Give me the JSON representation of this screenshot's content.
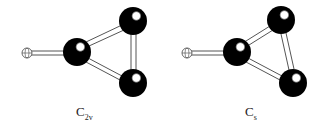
{
  "figure": {
    "type": "molecular-structure-comparison",
    "molecules": [
      {
        "symmetry_label": "C",
        "symmetry_subscript": "2v",
        "atoms": [
          {
            "role": "hydrogen",
            "x": 27,
            "y": 53,
            "r": 5
          },
          {
            "role": "heavy-center",
            "x": 77,
            "y": 52,
            "r": 14
          },
          {
            "role": "heavy-top",
            "x": 133,
            "y": 21,
            "r": 14
          },
          {
            "role": "heavy-bottom",
            "x": 133,
            "y": 83,
            "r": 14
          }
        ]
      },
      {
        "symmetry_label": "C",
        "symmetry_subscript": "s",
        "atoms": [
          {
            "role": "hydrogen",
            "x": 187,
            "y": 53,
            "r": 5
          },
          {
            "role": "heavy-center",
            "x": 237,
            "y": 52,
            "r": 14
          },
          {
            "role": "heavy-top",
            "x": 281,
            "y": 20,
            "r": 14
          },
          {
            "role": "heavy-bottom",
            "x": 293,
            "y": 83,
            "r": 14
          }
        ]
      }
    ]
  }
}
